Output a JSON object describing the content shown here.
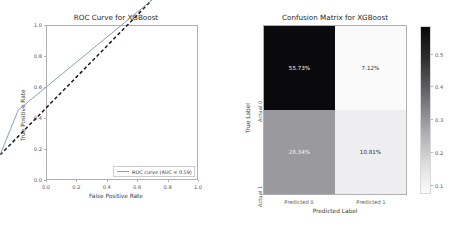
{
  "chart_data": [
    {
      "type": "line",
      "title": "ROC Curve for XGBoost",
      "xlabel": "False Positive Rate",
      "ylabel": "True Positive Rate",
      "xlim": [
        0.0,
        1.0
      ],
      "ylim": [
        0.0,
        1.0
      ],
      "grid": false,
      "legend_position": "lower right",
      "xticks": [
        "0.0",
        "0.2",
        "0.4",
        "0.6",
        "0.8",
        "1.0"
      ],
      "xtick_values": [
        0.0,
        0.2,
        0.4,
        0.6,
        0.8,
        1.0
      ],
      "yticks": [
        "0.0",
        "0.2",
        "0.4",
        "0.6",
        "0.8",
        "1.0"
      ],
      "ytick_values": [
        0.0,
        0.2,
        0.4,
        0.6,
        0.8,
        1.0
      ],
      "auc": 0.59,
      "series": [
        {
          "name": "ROC curve (AUC = 0.59)",
          "color": "#8a9fb8",
          "style": "solid",
          "x": [
            0.0,
            0.12,
            1.0
          ],
          "y": [
            0.0,
            0.29,
            1.0
          ]
        },
        {
          "name": "chance",
          "color": "#1a1a1a",
          "style": "dashed",
          "x": [
            0.0,
            1.0
          ],
          "y": [
            0.0,
            1.0
          ]
        }
      ]
    },
    {
      "type": "heatmap",
      "title": "Confusion Matrix for XGBoost",
      "xlabel": "Predicted Label",
      "ylabel": "True Label",
      "xticks": [
        "Predicted 0",
        "Predicted 1"
      ],
      "yticks": [
        "Actual 0",
        "Actual 1"
      ],
      "cells": [
        [
          {
            "label": "55.73%",
            "value": 0.5573,
            "bg": "#0a0a0c",
            "fg": "#f2f2f2"
          },
          {
            "label": "7.12%",
            "value": 0.0712,
            "bg": "#fafafb",
            "fg": "#303030"
          }
        ],
        [
          {
            "label": "26.34%",
            "value": 0.2634,
            "bg": "#9a9a9e",
            "fg": "#f2f2f2"
          },
          {
            "label": "10.81%",
            "value": 0.1081,
            "bg": "#eeeef0",
            "fg": "#303030"
          }
        ]
      ],
      "colorbar": {
        "ticks": [
          "0.5",
          "0.4",
          "0.3",
          "0.2",
          "0.1"
        ],
        "tick_values": [
          0.5,
          0.4,
          0.3,
          0.2,
          0.1
        ],
        "orientation": "vertical",
        "reversed": true
      }
    }
  ]
}
